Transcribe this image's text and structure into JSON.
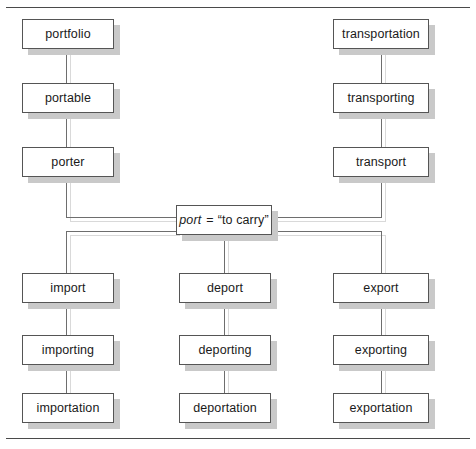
{
  "figure": {
    "background_color": "#ffffff",
    "frame_color": "#4a4a4a",
    "box_border_color": "#555555",
    "box_fill_color": "#ffffff",
    "shadow_color": "#c9c9c9",
    "connector_color": "#6e6e6e"
  },
  "root": {
    "term": "port",
    "equals": "=",
    "gloss": "“to carry”",
    "full_text": "port = “to carry”"
  },
  "branches": {
    "top_left": {
      "name": "portfolio-branch",
      "nodes": [
        {
          "label": "portfolio"
        },
        {
          "label": "portable"
        },
        {
          "label": "porter"
        }
      ]
    },
    "top_right": {
      "name": "transport-branch",
      "nodes": [
        {
          "label": "transportation"
        },
        {
          "label": "transporting"
        },
        {
          "label": "transport"
        }
      ]
    },
    "bottom_left": {
      "name": "import-branch",
      "nodes": [
        {
          "label": "import"
        },
        {
          "label": "importing"
        },
        {
          "label": "importation"
        }
      ]
    },
    "bottom_center": {
      "name": "deport-branch",
      "nodes": [
        {
          "label": "deport"
        },
        {
          "label": "deporting"
        },
        {
          "label": "deportation"
        }
      ]
    },
    "bottom_right": {
      "name": "export-branch",
      "nodes": [
        {
          "label": "export"
        },
        {
          "label": "exporting"
        },
        {
          "label": "exportation"
        }
      ]
    }
  }
}
